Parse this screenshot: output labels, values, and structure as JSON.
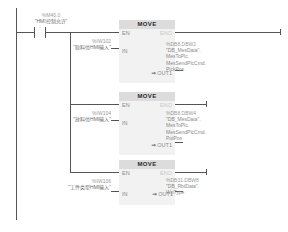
{
  "diagram": {
    "type": "ladder-logic",
    "language": "LAD",
    "contact": {
      "address": "%M40.0",
      "symbol": "\"HMI控制允许\"",
      "kind": "normally-open-contact"
    },
    "networks": [
      {
        "instruction": "MOVE",
        "en_label": "EN",
        "eno_label": "ENO",
        "in_label": "IN",
        "out_label": "OUT1",
        "out_arrow": "⇒",
        "input": {
          "address": "%IW102",
          "symbol": "\"取料位HMI输入\""
        },
        "output": {
          "address": "%DB8.DBW2",
          "symbol": "\"DB_MesData\".",
          "path_lines": [
            "MesToPlc.",
            "MesSendPlcCmd.",
            "PickPos"
          ]
        }
      },
      {
        "instruction": "MOVE",
        "en_label": "EN",
        "eno_label": "ENO",
        "in_label": "IN",
        "out_label": "OUT1",
        "out_arrow": "⇒",
        "input": {
          "address": "%IW104",
          "symbol": "\"放料位HMI输入\""
        },
        "output": {
          "address": "%DB8.DBW4",
          "symbol": "\"DB_MesData\".",
          "path_lines": [
            "MesToPlc.",
            "MesSendPlcCmd.",
            "PutPos"
          ]
        }
      },
      {
        "instruction": "MOVE",
        "en_label": "EN",
        "eno_label": "ENO",
        "in_label": "IN",
        "out_label": "OUT1",
        "out_arrow": "⇒",
        "input": {
          "address": "%IW106",
          "symbol": "\"工件类型HMI输入\""
        },
        "output": {
          "address": "%DB31.DBW8",
          "symbol": "\"DB_RbtData\".",
          "path_lines": [
            "WpType"
          ]
        }
      }
    ]
  }
}
